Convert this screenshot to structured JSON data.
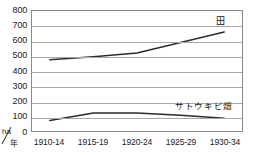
{
  "chart_data": {
    "type": "line",
    "title": "",
    "xlabel": "年",
    "ylabel": "ha",
    "unit_numerator": "ha",
    "unit_denominator": "年",
    "ylim": [
      0,
      800
    ],
    "ytick_step": 100,
    "grid": true,
    "legend_position": "inline-右",
    "categories": [
      "1910-14",
      "1915-19",
      "1920-24",
      "1925-29",
      "1930-34"
    ],
    "ytick_labels": [
      "800",
      "700",
      "600",
      "500",
      "400",
      "300",
      "200",
      "100",
      "0"
    ],
    "series": [
      {
        "name": "田",
        "values": [
          475,
          495,
          520,
          590,
          660
        ]
      },
      {
        "name": "サトウキビ畑",
        "values": [
          70,
          120,
          120,
          105,
          85
        ]
      }
    ]
  },
  "labels": {
    "series_ta": "田",
    "series_satoukibi": "サトウキビ畑"
  }
}
